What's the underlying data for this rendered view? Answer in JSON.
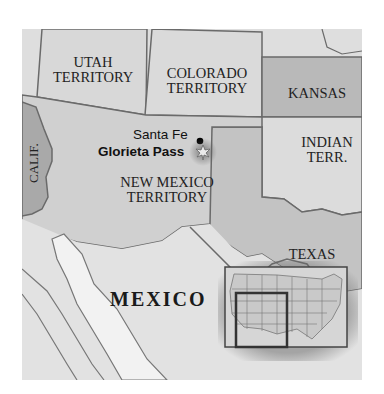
{
  "map": {
    "regions": [
      {
        "id": "utah",
        "label_line1": "UTAH",
        "label_line2": "TERRITORY"
      },
      {
        "id": "colorado",
        "label_line1": "COLORADO",
        "label_line2": "TERRITORY"
      },
      {
        "id": "kansas",
        "label_line1": "KANSAS"
      },
      {
        "id": "indian",
        "label_line1": "INDIAN",
        "label_line2": "TERR."
      },
      {
        "id": "new_mexico",
        "label_line1": "NEW MEXICO",
        "label_line2": "TERRITORY"
      },
      {
        "id": "texas",
        "label_line1": "TEXAS"
      },
      {
        "id": "calif",
        "label_line1": "CALIF."
      },
      {
        "id": "mexico",
        "label_line1": "MEXICO"
      }
    ],
    "places": [
      {
        "name": "Santa Fe",
        "marker": "dot-icon"
      },
      {
        "name": "Glorieta Pass",
        "marker": "battle-burst-icon"
      }
    ],
    "inset": {
      "description": "United States locator map with highlighted southwest region"
    },
    "colors": {
      "land_light": "#dcdcdc",
      "territory_dark": "#b8b8b8",
      "border": "#6a6a6a",
      "water": "#eeeeee",
      "santa_fe_dot": "#000000"
    }
  }
}
